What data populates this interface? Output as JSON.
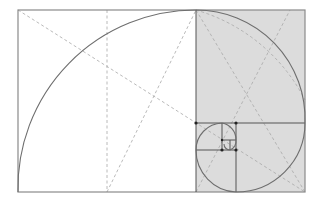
{
  "diagram": {
    "type": "golden-rectangle-spiral",
    "colors": {
      "background": "#ffffff",
      "shade": "#dcdcdc",
      "frame": "#8a8a8a",
      "spiral": "#6e6e6e",
      "dashed": "#a8a8a8",
      "subdivision": "#555555",
      "dot": "#222222"
    },
    "outer_rect": {
      "x": 18,
      "y": 10,
      "w": 287,
      "h": 182
    },
    "squares": [
      {
        "x": 18,
        "y": 10,
        "s": 178
      },
      {
        "x": 196,
        "y": 10,
        "s": 109
      },
      {
        "x": 236,
        "y": 123,
        "s": 69
      },
      {
        "x": 196,
        "y": 150,
        "s": 42
      },
      {
        "x": 196,
        "y": 123,
        "s": 27
      }
    ]
  }
}
